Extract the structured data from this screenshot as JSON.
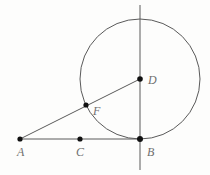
{
  "figure": {
    "type": "geometry-diagram",
    "width": 210,
    "height": 175,
    "background_color": "#fdfdfc",
    "stroke_color": "#5a5a5a",
    "point_color": "#111111",
    "label_color": "#6f6f6f"
  },
  "points": {
    "A": {
      "label": "A",
      "x": 20,
      "y": 139,
      "label_x": 17,
      "label_y": 146
    },
    "B": {
      "label": "B",
      "x": 140,
      "y": 139,
      "label_x": 147,
      "label_y": 146
    },
    "C": {
      "label": "C",
      "x": 80,
      "y": 139,
      "label_x": 76,
      "label_y": 146
    },
    "D": {
      "label": "D",
      "x": 140,
      "y": 79,
      "label_x": 148,
      "label_y": 74
    },
    "F": {
      "label": "F",
      "x": 86,
      "y": 105,
      "label_x": 93,
      "label_y": 105
    }
  },
  "circle": {
    "name": "circle-center-D",
    "center_x": 140,
    "center_y": 79,
    "radius": 60
  },
  "segments": [
    {
      "name": "segment-A-B",
      "from": "A",
      "to": "B",
      "x1": 20,
      "y1": 139,
      "x2": 140,
      "y2": 139
    },
    {
      "name": "segment-A-D",
      "from": "A",
      "to": "D",
      "x1": 20,
      "y1": 139,
      "x2": 140,
      "y2": 79
    },
    {
      "name": "line-vertical-through-B-and-D",
      "from": "top",
      "to": "bottom",
      "x1": 140,
      "y1": 5,
      "x2": 140,
      "y2": 170
    }
  ]
}
